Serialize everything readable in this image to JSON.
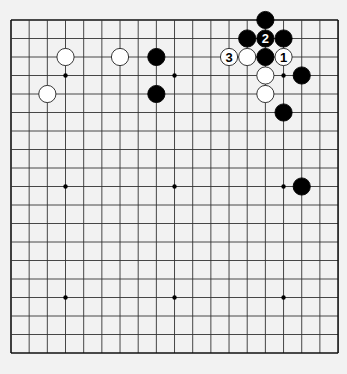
{
  "diagram": {
    "type": "go-board",
    "board_size": 19,
    "colors": {
      "background": "#f2f2f2",
      "board": "#f0f0f0",
      "line": "#333333",
      "border": "#111111",
      "black_stone": "#000000",
      "white_stone": "#ffffff",
      "white_stone_outline": "#222222"
    },
    "geometry": {
      "origin_x": 11,
      "origin_y": 20,
      "cell_w": 18.17,
      "cell_h": 18.5,
      "stone_radius": 8.6,
      "hoshi_radius": 2.2
    },
    "hoshi": [
      [
        3,
        3
      ],
      [
        9,
        3
      ],
      [
        15,
        3
      ],
      [
        3,
        9
      ],
      [
        9,
        9
      ],
      [
        15,
        9
      ],
      [
        3,
        15
      ],
      [
        9,
        15
      ],
      [
        15,
        15
      ]
    ],
    "stones": [
      {
        "color": "black",
        "col": 14,
        "row": 0,
        "label": ""
      },
      {
        "color": "black",
        "col": 13,
        "row": 1,
        "label": ""
      },
      {
        "color": "black",
        "col": 14,
        "row": 1,
        "label": "2"
      },
      {
        "color": "black",
        "col": 15,
        "row": 1,
        "label": ""
      },
      {
        "color": "white",
        "col": 3,
        "row": 2,
        "label": ""
      },
      {
        "color": "white",
        "col": 6,
        "row": 2,
        "label": ""
      },
      {
        "color": "black",
        "col": 8,
        "row": 2,
        "label": ""
      },
      {
        "color": "white",
        "col": 12,
        "row": 2,
        "label": "3"
      },
      {
        "color": "white",
        "col": 13,
        "row": 2,
        "label": ""
      },
      {
        "color": "black",
        "col": 14,
        "row": 2,
        "label": ""
      },
      {
        "color": "white",
        "col": 15,
        "row": 2,
        "label": "1"
      },
      {
        "color": "white",
        "col": 14,
        "row": 3,
        "label": ""
      },
      {
        "color": "black",
        "col": 16,
        "row": 3,
        "label": ""
      },
      {
        "color": "white",
        "col": 2,
        "row": 4,
        "label": ""
      },
      {
        "color": "black",
        "col": 8,
        "row": 4,
        "label": ""
      },
      {
        "color": "white",
        "col": 14,
        "row": 4,
        "label": ""
      },
      {
        "color": "black",
        "col": 15,
        "row": 5,
        "label": ""
      },
      {
        "color": "black",
        "col": 16,
        "row": 9,
        "label": ""
      }
    ]
  }
}
